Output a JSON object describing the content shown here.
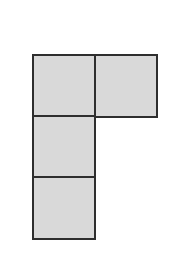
{
  "diagram": {
    "type": "polyomino-net",
    "fill_color": "#d9d9d9",
    "stroke_color": "#2e2e2e",
    "cell_size": 63,
    "cells": [
      {
        "id": "top-left",
        "x": 32,
        "y": 54
      },
      {
        "id": "top-right",
        "x": 94,
        "y": 54
      },
      {
        "id": "middle-left",
        "x": 32,
        "y": 115
      },
      {
        "id": "bottom-left",
        "x": 32,
        "y": 176
      }
    ]
  }
}
